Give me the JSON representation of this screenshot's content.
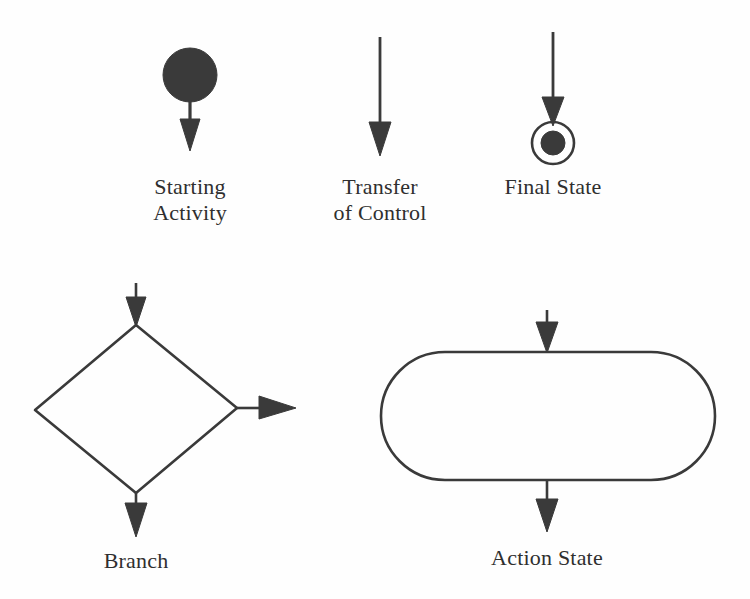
{
  "figure": {
    "kind": "uml-activity-diagram-notation-legend",
    "background_color": "#fefefe",
    "ink_color": "#3a3a3a",
    "text_color": "#2f2f2f",
    "width": 750,
    "height": 599
  },
  "symbols": [
    {
      "id": "starting-activity",
      "label_lines": [
        "Starting",
        "Activity"
      ],
      "shape": "filled-circle-with-outgoing-arrow",
      "circle": {
        "cx": 190,
        "cy": 75,
        "r": 27,
        "fill": "#3a3a3a"
      },
      "arrow": {
        "x": 190,
        "y1": 102,
        "y2": 150,
        "direction": "down"
      }
    },
    {
      "id": "transfer-of-control",
      "label_lines": [
        "Transfer",
        "of Control"
      ],
      "shape": "arrow",
      "arrow": {
        "x": 380,
        "y1": 37,
        "y2": 155,
        "direction": "down"
      }
    },
    {
      "id": "final-state",
      "label_lines": [
        "Final State"
      ],
      "shape": "bullseye-with-incoming-arrow",
      "arrow": {
        "x": 553,
        "y1": 32,
        "y2": 124,
        "direction": "down"
      },
      "outer_circle": {
        "cx": 553,
        "cy": 143,
        "r": 21,
        "fill": "none"
      },
      "inner_circle": {
        "cx": 553,
        "cy": 143,
        "r": 12,
        "fill": "#3a3a3a"
      }
    },
    {
      "id": "branch",
      "label_lines": [
        "Branch"
      ],
      "shape": "diamond-with-three-arrows",
      "diamond": {
        "top": {
          "x": 136,
          "y": 325
        },
        "left": {
          "x": 35,
          "y": 410
        },
        "right": {
          "x": 237,
          "y": 408
        },
        "bottom": {
          "x": 136,
          "y": 493
        }
      },
      "arrow_in_top": {
        "x": 136,
        "y1": 283,
        "y2": 325,
        "direction": "down"
      },
      "arrow_out_right": {
        "y": 408,
        "x1": 237,
        "x2": 296,
        "direction": "right"
      },
      "arrow_out_bottom": {
        "x": 136,
        "y1": 493,
        "y2": 536,
        "direction": "down"
      }
    },
    {
      "id": "action-state",
      "label_lines": [
        "Action State"
      ],
      "shape": "stadium-with-two-arrows",
      "stadium": {
        "x": 381,
        "y": 352,
        "width": 334,
        "height": 128,
        "radius": 64,
        "fill": "none"
      },
      "arrow_in_top": {
        "x": 547,
        "y1": 310,
        "y2": 352,
        "direction": "down"
      },
      "arrow_out_bottom": {
        "x": 547,
        "y1": 480,
        "y2": 531,
        "direction": "down"
      }
    }
  ]
}
